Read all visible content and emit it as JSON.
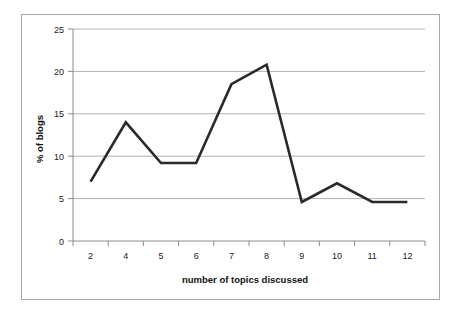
{
  "chart_data": {
    "type": "line",
    "title": "",
    "xlabel": "number of topics discussed",
    "ylabel": "% of blogs",
    "categories": [
      "2",
      "4",
      "5",
      "6",
      "7",
      "8",
      "9",
      "10",
      "11",
      "12"
    ],
    "values": [
      7.0,
      14.0,
      9.2,
      9.2,
      18.5,
      20.8,
      4.6,
      6.8,
      4.6,
      4.6
    ],
    "series": [
      {
        "name": "% of blogs",
        "values": [
          7.0,
          14.0,
          9.2,
          9.2,
          18.5,
          20.8,
          4.6,
          6.8,
          4.6,
          4.6
        ]
      }
    ],
    "ylim": [
      0,
      25
    ],
    "ytick_labels": [
      "0",
      "5",
      "10",
      "15",
      "20",
      "25"
    ],
    "ytick_values": [
      0,
      5,
      10,
      15,
      20,
      25
    ],
    "grid": "horizontal",
    "legend": "none",
    "line_color": "#2a2a2a",
    "grid_color": "#b3b3b3",
    "axis_color": "#8c8c8c",
    "frame_color": "#a8a8a8",
    "background": "#ffffff"
  },
  "labels": {
    "y_axis_title": "% of blogs",
    "x_axis_title": "number of topics discussed",
    "y_ticks": [
      "25",
      "20",
      "15",
      "10",
      "5",
      "0"
    ],
    "x_ticks": [
      "2",
      "4",
      "5",
      "6",
      "7",
      "8",
      "9",
      "10",
      "11",
      "12"
    ]
  }
}
